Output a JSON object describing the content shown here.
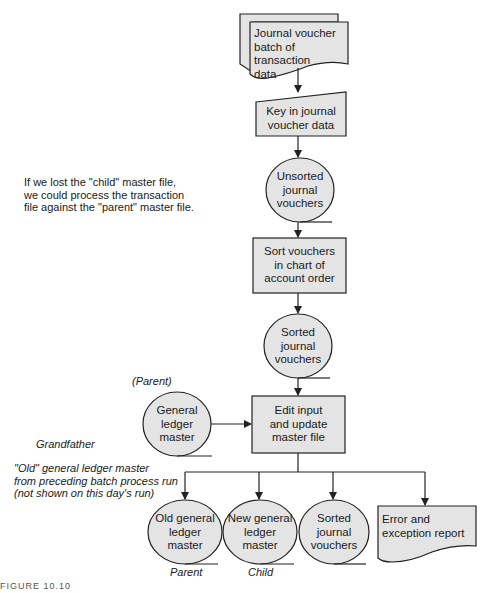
{
  "colors": {
    "shape_fill": "#e4e4e4",
    "stroke": "#222222",
    "background": "#ffffff"
  },
  "nodes": {
    "journal_voucher_batch": {
      "type": "document-stack",
      "label_lines": [
        "Journal voucher",
        "batch of transaction",
        "data"
      ]
    },
    "key_in": {
      "type": "manual-input",
      "label_lines": [
        "Key in journal",
        "voucher data"
      ]
    },
    "unsorted_vouchers": {
      "type": "sequential-file",
      "label_lines": [
        "Unsorted",
        "journal",
        "vouchers"
      ]
    },
    "sort_vouchers": {
      "type": "process",
      "label_lines": [
        "Sort vouchers",
        "in chart of",
        "account order"
      ]
    },
    "sorted_vouchers_1": {
      "type": "sequential-file",
      "label_lines": [
        "Sorted",
        "journal",
        "vouchers"
      ]
    },
    "general_ledger_master": {
      "type": "sequential-file",
      "label_lines": [
        "General",
        "ledger",
        "master"
      ]
    },
    "edit_update": {
      "type": "process",
      "label_lines": [
        "Edit input",
        "and update",
        "master file"
      ]
    },
    "old_gl_master": {
      "type": "sequential-file",
      "label_lines": [
        "Old general",
        "ledger",
        "master"
      ]
    },
    "new_gl_master": {
      "type": "sequential-file",
      "label_lines": [
        "New general",
        "ledger",
        "master"
      ]
    },
    "sorted_vouchers_2": {
      "type": "sequential-file",
      "label_lines": [
        "Sorted",
        "journal",
        "vouchers"
      ]
    },
    "error_report": {
      "type": "document",
      "label_lines": [
        "Error and",
        "exception report"
      ]
    }
  },
  "annotations": {
    "child_note": [
      "If we lost the \"child\" master file,",
      "we could process the transaction",
      "file against the \"parent\" master file."
    ],
    "parent_top": "(Parent)",
    "grandfather": "Grandfather",
    "old_note": [
      "\"Old\" general ledger master",
      "from preceding batch process run",
      "(not shown on this day's run)"
    ],
    "parent_bottom": "Parent",
    "child_bottom": "Child"
  },
  "caption": "FIGURE 10.10"
}
